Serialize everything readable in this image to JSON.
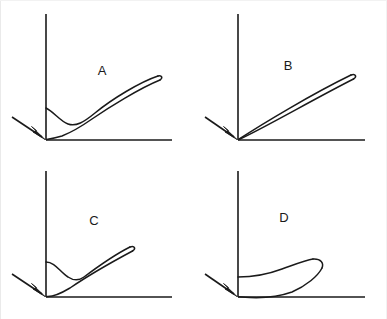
{
  "figure": {
    "title": "",
    "background_color": "#ffffff",
    "stroke_color": "#1a1a1a",
    "width": 387,
    "height": 319,
    "border": {
      "visible": true,
      "color": "#e8e8e8",
      "sides": "left-top-right"
    }
  },
  "panels": [
    {
      "id": "A",
      "label": "A",
      "label_x": 102,
      "label_y": 75,
      "origin_x": 46,
      "origin_y": 140,
      "y_axis_top": 14,
      "x_axis_right": 172,
      "curve_type": "hysteresis-loop-with-concave-dip",
      "description": "Thin elongated loop rising to upper right from a concave dip near the vertical axis",
      "tip_x": 160,
      "tip_y": 78,
      "arrow": {
        "from_x": 12,
        "from_y": 117,
        "to_x": 44,
        "to_y": 138
      }
    },
    {
      "id": "B",
      "label": "B",
      "label_x": 288,
      "label_y": 70,
      "origin_x": 238,
      "origin_y": 140,
      "y_axis_top": 14,
      "x_axis_right": 365,
      "curve_type": "narrow-straight-loop",
      "description": "Very narrow straight loop from origin to upper right tip",
      "tip_x": 355,
      "tip_y": 78,
      "arrow": {
        "from_x": 205,
        "from_y": 117,
        "to_x": 236,
        "to_y": 138
      }
    },
    {
      "id": "C",
      "label": "C",
      "label_x": 94,
      "label_y": 225,
      "origin_x": 46,
      "origin_y": 297,
      "y_axis_top": 171,
      "x_axis_right": 172,
      "curve_type": "loop-with-deep-dip",
      "description": "Loop with pronounced downward dip near axis then rise to upper right tip",
      "tip_x": 133,
      "tip_y": 247,
      "arrow": {
        "from_x": 12,
        "from_y": 275,
        "to_x": 44,
        "to_y": 295
      }
    },
    {
      "id": "D",
      "label": "D",
      "label_x": 284,
      "label_y": 222,
      "origin_x": 238,
      "origin_y": 297,
      "y_axis_top": 171,
      "x_axis_right": 365,
      "curve_type": "teardrop-loop",
      "description": "Wide teardrop loop bulging right, attached to vertical axis and base",
      "tip_x": 313,
      "tip_y": 262,
      "arrow": {
        "from_x": 205,
        "from_y": 275,
        "to_x": 236,
        "to_y": 295
      }
    }
  ]
}
